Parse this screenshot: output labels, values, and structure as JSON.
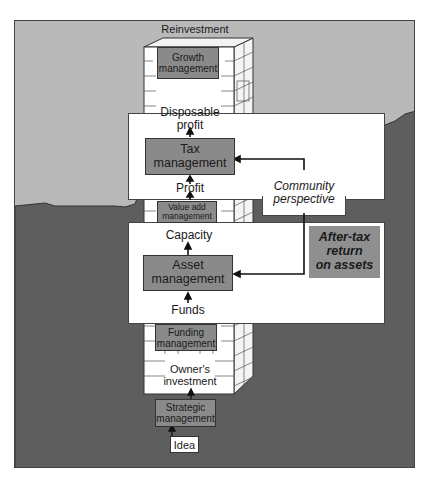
{
  "diagram": {
    "title": "",
    "colors": {
      "sky": "#b9b9b9",
      "ground": "#5e5e5e",
      "box_fill": "#8a8a8a",
      "panel": "#ffffff",
      "after_tax_fill": "#8f8f8f"
    },
    "tower_labels": {
      "reinvestment": "Reinvestment",
      "growth_management": "Growth\nmanagement",
      "disposable_profit": "Disposable\nprofit",
      "tax_management": "Tax\nmanagement",
      "profit": "Profit",
      "value_add_management": "Value add\nmanagement",
      "capacity": "Capacity",
      "asset_management": "Asset\nmanagement",
      "funds": "Funds",
      "funding_management": "Funding\nmanagement",
      "owners_investment": "Owner's\ninvestment",
      "strategic_management": "Strategic\nmanagement",
      "idea": "Idea"
    },
    "callouts": {
      "community_perspective": "Community\nperspective",
      "after_tax_return": "After-tax\nreturn\non assets"
    },
    "flow": [
      "Idea",
      "Strategic management",
      "Owner's investment",
      "Funding management",
      "Funds",
      "Asset management",
      "Capacity",
      "Value add management",
      "Profit",
      "Tax management",
      "Disposable profit",
      "Growth management",
      "Reinvestment"
    ],
    "feedback_edges": [
      {
        "from": "Community perspective",
        "to": "Tax management"
      },
      {
        "from": "Community perspective",
        "to": "Asset management"
      }
    ]
  }
}
